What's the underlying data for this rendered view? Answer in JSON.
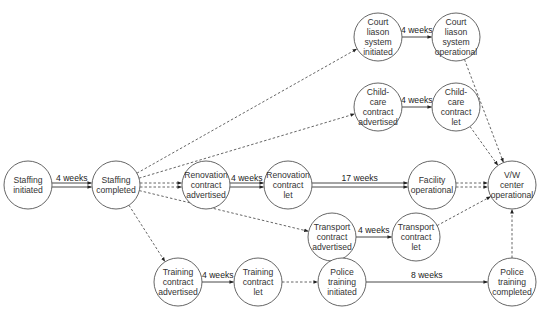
{
  "diagram": {
    "type": "activity-network",
    "colors": {
      "node_stroke": "#555555",
      "edge_solid": "#333333",
      "edge_dashed": "#555555",
      "text": "#333333"
    },
    "node_radius": 24,
    "nodes": [
      {
        "id": "staffing_initiated",
        "lines": [
          "Staffing",
          "initiated"
        ],
        "cx": 28,
        "cy": 185
      },
      {
        "id": "staffing_completed",
        "lines": [
          "Staffing",
          "completed"
        ],
        "cx": 116,
        "cy": 185
      },
      {
        "id": "renovation_advertised",
        "lines": [
          "Renovation",
          "contract",
          "advertised"
        ],
        "cx": 206,
        "cy": 185
      },
      {
        "id": "renovation_let",
        "lines": [
          "Renovation",
          "contract",
          "let"
        ],
        "cx": 288,
        "cy": 185
      },
      {
        "id": "facility_operational",
        "lines": [
          "Facility",
          "operational"
        ],
        "cx": 432,
        "cy": 185
      },
      {
        "id": "vw_center_operational",
        "lines": [
          "V/W",
          "center",
          "operational"
        ],
        "cx": 512,
        "cy": 185
      },
      {
        "id": "court_initiated",
        "lines": [
          "Court",
          "liason",
          "system",
          "initiated"
        ],
        "cx": 378,
        "cy": 37
      },
      {
        "id": "court_operational",
        "lines": [
          "Court",
          "liason",
          "system",
          "operational"
        ],
        "cx": 456,
        "cy": 37
      },
      {
        "id": "childcare_advertised",
        "lines": [
          "Child-",
          "care",
          "contract",
          "advertised"
        ],
        "cx": 378,
        "cy": 107
      },
      {
        "id": "childcare_let",
        "lines": [
          "Child-",
          "care",
          "contract",
          "let"
        ],
        "cx": 456,
        "cy": 107
      },
      {
        "id": "transport_advertised",
        "lines": [
          "Transport",
          "contract",
          "advertised"
        ],
        "cx": 332,
        "cy": 237
      },
      {
        "id": "transport_let",
        "lines": [
          "Transport",
          "contract",
          "let"
        ],
        "cx": 416,
        "cy": 237
      },
      {
        "id": "training_advertised",
        "lines": [
          "Training",
          "contract",
          "advertised"
        ],
        "cx": 178,
        "cy": 282
      },
      {
        "id": "training_let",
        "lines": [
          "Training",
          "contract",
          "let"
        ],
        "cx": 258,
        "cy": 282
      },
      {
        "id": "police_initiated",
        "lines": [
          "Police",
          "training",
          "initiated"
        ],
        "cx": 342,
        "cy": 282
      },
      {
        "id": "police_completed",
        "lines": [
          "Police",
          "training",
          "completed"
        ],
        "cx": 512,
        "cy": 282
      }
    ],
    "edges": [
      {
        "from": "staffing_initiated",
        "to": "staffing_completed",
        "style": "double-solid",
        "label": "4 weeks"
      },
      {
        "from": "staffing_completed",
        "to": "renovation_advertised",
        "style": "double-dashed",
        "label": ""
      },
      {
        "from": "renovation_advertised",
        "to": "renovation_let",
        "style": "double-solid",
        "label": "4 weeks"
      },
      {
        "from": "renovation_let",
        "to": "facility_operational",
        "style": "double-solid",
        "label": "17 weeks"
      },
      {
        "from": "facility_operational",
        "to": "vw_center_operational",
        "style": "double-dashed",
        "label": ""
      },
      {
        "from": "staffing_completed",
        "to": "court_initiated",
        "style": "dashed",
        "label": ""
      },
      {
        "from": "court_initiated",
        "to": "court_operational",
        "style": "solid",
        "label": "4 weeks"
      },
      {
        "from": "court_operational",
        "to": "vw_center_operational",
        "style": "dashed",
        "label": ""
      },
      {
        "from": "staffing_completed",
        "to": "childcare_advertised",
        "style": "dashed",
        "label": ""
      },
      {
        "from": "childcare_advertised",
        "to": "childcare_let",
        "style": "solid",
        "label": "4 weeks"
      },
      {
        "from": "childcare_let",
        "to": "vw_center_operational",
        "style": "dashed",
        "label": ""
      },
      {
        "from": "staffing_completed",
        "to": "transport_advertised",
        "style": "dashed",
        "label": ""
      },
      {
        "from": "transport_advertised",
        "to": "transport_let",
        "style": "solid",
        "label": "4 weeks"
      },
      {
        "from": "transport_let",
        "to": "vw_center_operational",
        "style": "dashed",
        "label": ""
      },
      {
        "from": "staffing_completed",
        "to": "training_advertised",
        "style": "dashed",
        "label": ""
      },
      {
        "from": "training_advertised",
        "to": "training_let",
        "style": "solid",
        "label": "4 weeks"
      },
      {
        "from": "training_let",
        "to": "police_initiated",
        "style": "dashed",
        "label": ""
      },
      {
        "from": "police_initiated",
        "to": "police_completed",
        "style": "solid",
        "label": "8 weeks"
      },
      {
        "from": "police_completed",
        "to": "vw_center_operational",
        "style": "dashed",
        "label": ""
      }
    ]
  }
}
